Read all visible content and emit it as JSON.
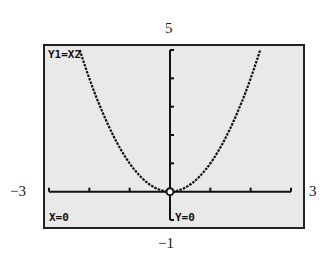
{
  "chart_data": {
    "type": "line",
    "title": "",
    "function": "Y1=X²",
    "xlabel": "",
    "ylabel": "",
    "xlim": [
      -3,
      3
    ],
    "ylim": [
      -1,
      5
    ],
    "xscale": 1,
    "yscale": 1,
    "grid": false,
    "series": [
      {
        "name": "Y1=X2",
        "x": [
          -2.25,
          -2.0,
          -1.5,
          -1.0,
          -0.5,
          0,
          0.5,
          1.0,
          1.5,
          2.0,
          2.25
        ],
        "y": [
          5.06,
          4.0,
          2.25,
          1.0,
          0.25,
          0,
          0.25,
          1.0,
          2.25,
          4.0,
          5.06
        ]
      }
    ],
    "trace_point": {
      "x": 0,
      "y": 0
    }
  },
  "window": {
    "ymax_label": "5",
    "ymin_label": "−1",
    "xmin_label": "−3",
    "xmax_label": "3"
  },
  "screen": {
    "equation_label": "Y1=X2",
    "x_readout": "X=0",
    "y_readout": "Y=0"
  },
  "colors": {
    "screen_bg": "#e9e9e9",
    "ink": "#111111"
  }
}
